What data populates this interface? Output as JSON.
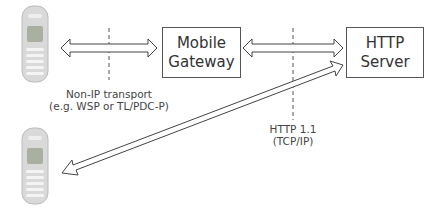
{
  "diagram": {
    "nodes": {
      "mobile_gateway": {
        "line1": "Mobile",
        "line2": "Gateway"
      },
      "http_server": {
        "line1": "HTTP",
        "line2": "Server"
      },
      "phone_top": {
        "icon": "mobile-phone-icon"
      },
      "phone_bottom": {
        "icon": "mobile-phone-icon"
      }
    },
    "labels": {
      "non_ip": {
        "line1": "Non-IP transport",
        "line2": "(e.g. WSP or TL/PDC-P)"
      },
      "http": {
        "line1": "HTTP 1.1",
        "line2": "(TCP/IP)"
      }
    },
    "edges": [
      {
        "from": "phone_top",
        "to": "mobile_gateway",
        "type": "bidirectional"
      },
      {
        "from": "mobile_gateway",
        "to": "http_server",
        "type": "bidirectional"
      },
      {
        "from": "phone_bottom",
        "to": "http_server",
        "type": "bidirectional"
      }
    ],
    "colors": {
      "line": "#555555",
      "text": "#333333",
      "phone_body": "#d8d8d8"
    }
  }
}
